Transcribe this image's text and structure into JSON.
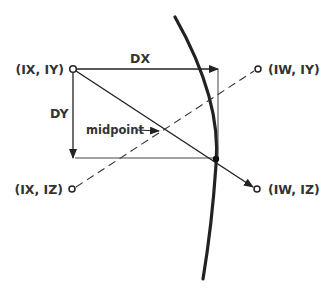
{
  "diagram": {
    "points": {
      "ix_iy": {
        "label": "(IX, IY)",
        "x": 73,
        "y": 69
      },
      "iw_iy": {
        "label": "(IW, IY)",
        "x": 258,
        "y": 69
      },
      "ix_iz": {
        "label": "(IX, IZ)",
        "x": 72,
        "y": 189
      },
      "iw_iz": {
        "label": "(IW, IZ)",
        "x": 257,
        "y": 189
      }
    },
    "labels": {
      "dx": "DX",
      "dy": "DY",
      "midpoint": "midpoint"
    },
    "colors": {
      "ink": "#222222",
      "text": "#333333",
      "background": "#ffffff"
    }
  }
}
